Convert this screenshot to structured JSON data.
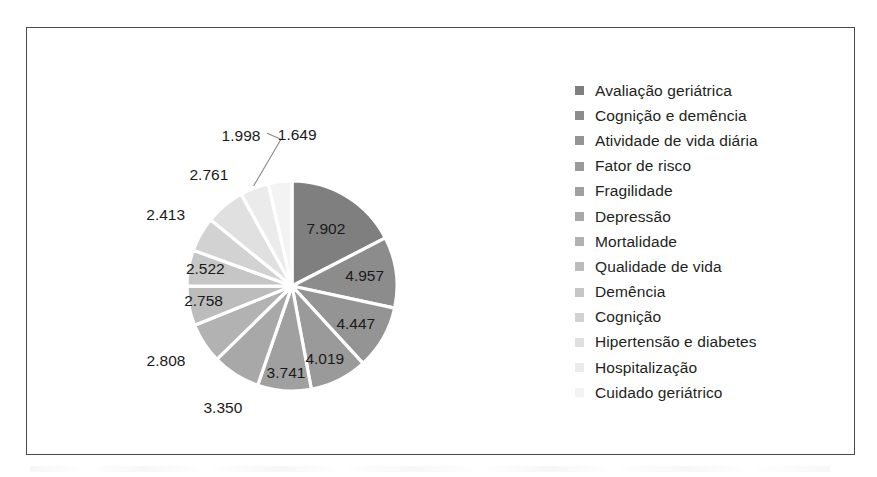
{
  "chart_data": {
    "type": "pie",
    "title": "",
    "xlabel": "",
    "ylabel": "",
    "legend_position": "right",
    "grid": false,
    "start_angle_deg": 0,
    "direction": "clockwise",
    "total": 43325,
    "categories": [
      "Avaliação geriátrica",
      "Cognição e demência",
      "Atividade de vida diária",
      "Fator de risco",
      "Fragilidade",
      "Depressão",
      "Mortalidade",
      "Qualidade de vida",
      "Demência",
      "Cognição",
      "Hipertensão e diabetes",
      "Hospitalização",
      "Cuidado geriátrico"
    ],
    "values": [
      7902,
      4957,
      4447,
      4019,
      3741,
      3350,
      2808,
      2758,
      2522,
      2413,
      2761,
      1998,
      1649
    ],
    "value_labels": [
      "7.902",
      "4.957",
      "4.447",
      "4.019",
      "3.741",
      "3.350",
      "2.808",
      "2.758",
      "2.522",
      "2.413",
      "2.761",
      "1.998",
      "1.649"
    ],
    "slice_colors": [
      "#7f7f7f",
      "#8c8c8c",
      "#949494",
      "#9a9a9a",
      "#a0a0a0",
      "#a8a8a8",
      "#b2b2b2",
      "#bcbcbc",
      "#c6c6c6",
      "#d2d2d2",
      "#e0e0e0",
      "#ebebeb",
      "#f3f3f3"
    ],
    "separator_color": "#ffffff",
    "label_text_color": "#1a1a1a",
    "frame_border_color": "#4a4a4a",
    "background_color": "#ffffff",
    "label_placement": [
      "inside",
      "inside",
      "inside",
      "inside",
      "inside",
      "outside",
      "outside",
      "outside",
      "outside",
      "outside",
      "outside",
      "outside-leader",
      "outside"
    ]
  },
  "legend": {
    "items": [
      {
        "label": "Avaliação geriátrica",
        "color": "#7f7f7f"
      },
      {
        "label": "Cognição e demência",
        "color": "#8c8c8c"
      },
      {
        "label": "Atividade de vida diária",
        "color": "#949494"
      },
      {
        "label": "Fator de risco",
        "color": "#9a9a9a"
      },
      {
        "label": "Fragilidade",
        "color": "#a0a0a0"
      },
      {
        "label": "Depressão",
        "color": "#a8a8a8"
      },
      {
        "label": "Mortalidade",
        "color": "#b2b2b2"
      },
      {
        "label": "Qualidade de vida",
        "color": "#bcbcbc"
      },
      {
        "label": "Demência",
        "color": "#c6c6c6"
      },
      {
        "label": "Cognição",
        "color": "#d2d2d2"
      },
      {
        "label": "Hipertensão e diabetes",
        "color": "#e0e0e0"
      },
      {
        "label": "Hospitalização",
        "color": "#ebebeb"
      },
      {
        "label": "Cuidado geriátrico",
        "color": "#f3f3f3"
      }
    ]
  }
}
